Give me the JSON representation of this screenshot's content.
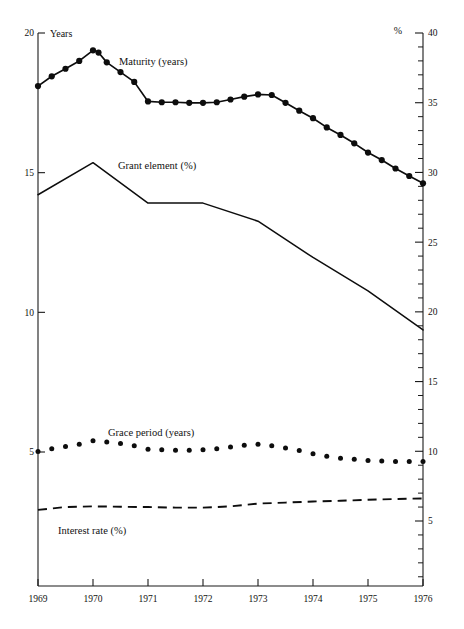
{
  "chart_data": {
    "type": "line",
    "title": "",
    "xlabel": "",
    "ylabel": "Years",
    "y2label": "%",
    "left_axis": {
      "unit": "Years",
      "ticks": [
        20,
        15,
        10,
        5
      ],
      "tick_labels": [
        "20",
        "15",
        "10",
        "5"
      ],
      "ylim": [
        3.2,
        20
      ]
    },
    "right_axis": {
      "unit": "%",
      "ticks": [
        40,
        35,
        30,
        25,
        20,
        15,
        10,
        5
      ],
      "tick_labels": [
        "40",
        "35",
        "30",
        "25",
        "20",
        "15",
        "10",
        "5"
      ],
      "minor_tick_step": 1,
      "ylim": [
        1.4,
        40
      ]
    },
    "x": [
      1969,
      1970,
      1971,
      1972,
      1973,
      1974,
      1975,
      1976
    ],
    "tick_labels_x": [
      "1969",
      "1970",
      "1971",
      "1972",
      "1973",
      "1974",
      "1975",
      "1976"
    ],
    "xlim": [
      1969,
      1976
    ],
    "grid": false,
    "legend_position": "inline-annotations",
    "series": [
      {
        "name": "Maturity (years)",
        "label": "Maturity (years)",
        "axis": "left",
        "style": "line-with-markers",
        "marker": "filled-circle",
        "x": [
          1969.0,
          1969.25,
          1969.5,
          1969.75,
          1970.0,
          1970.1,
          1970.25,
          1970.5,
          1970.75,
          1971.0,
          1971.25,
          1971.5,
          1971.75,
          1972.0,
          1972.25,
          1972.5,
          1972.75,
          1973.0,
          1973.25,
          1973.5,
          1973.75,
          1974.0,
          1974.25,
          1974.5,
          1974.75,
          1975.0,
          1975.25,
          1975.5,
          1975.75,
          1976.0
        ],
        "values": [
          18.1,
          18.45,
          18.72,
          19.0,
          19.38,
          19.3,
          18.95,
          18.6,
          18.25,
          17.55,
          17.52,
          17.52,
          17.5,
          17.5,
          17.52,
          17.62,
          17.72,
          17.8,
          17.78,
          17.5,
          17.22,
          16.95,
          16.62,
          16.35,
          16.05,
          15.72,
          15.45,
          15.15,
          14.88,
          14.62
        ]
      },
      {
        "name": "Grant element (%)",
        "label": "Grant element (%)",
        "axis": "right",
        "style": "solid-line",
        "marker": "none",
        "x": [
          1969,
          1970,
          1971,
          1972,
          1973,
          1974,
          1975,
          1976
        ],
        "values": [
          28.4,
          30.7,
          27.8,
          27.8,
          26.5,
          23.9,
          21.5,
          18.7
        ]
      },
      {
        "name": "Grace period (years)",
        "label": "Grace period (years)",
        "axis": "left",
        "style": "dotted-markers",
        "marker": "small-filled-circle",
        "x": [
          1969.0,
          1969.25,
          1969.5,
          1969.75,
          1970.0,
          1970.25,
          1970.5,
          1970.75,
          1971.0,
          1971.25,
          1971.5,
          1971.75,
          1972.0,
          1972.25,
          1972.5,
          1972.75,
          1973.0,
          1973.25,
          1973.5,
          1973.75,
          1974.0,
          1974.25,
          1974.5,
          1974.75,
          1975.0,
          1975.25,
          1975.5,
          1975.75,
          1976.0
        ],
        "values": [
          5.02,
          5.12,
          5.2,
          5.28,
          5.4,
          5.36,
          5.3,
          5.22,
          5.1,
          5.08,
          5.06,
          5.06,
          5.08,
          5.12,
          5.18,
          5.24,
          5.28,
          5.22,
          5.14,
          5.05,
          4.94,
          4.85,
          4.78,
          4.74,
          4.7,
          4.68,
          4.66,
          4.66,
          4.66
        ]
      },
      {
        "name": "Interest rate (%)",
        "label": "Interest rate (%)",
        "axis": "right",
        "style": "dashed-line",
        "marker": "none",
        "x": [
          1969.0,
          1969.5,
          1970.0,
          1970.5,
          1971.0,
          1971.5,
          1972.0,
          1972.5,
          1973.0,
          1973.5,
          1974.0,
          1974.5,
          1975.0,
          1975.5,
          1976.0
        ],
        "values": [
          5.8,
          6.0,
          6.05,
          6.02,
          6.0,
          5.96,
          5.96,
          6.05,
          6.25,
          6.32,
          6.4,
          6.45,
          6.52,
          6.58,
          6.62
        ]
      }
    ],
    "annotations": [
      {
        "text": "Maturity (years)",
        "x_px": 119,
        "y_px": 65,
        "anchor": "start"
      },
      {
        "text": "Grant element (%)",
        "x_px": 118,
        "y_px": 169,
        "anchor": "start"
      },
      {
        "text": "Grace period (years)",
        "x_px": 108,
        "y_px": 436,
        "anchor": "start"
      },
      {
        "text": "Interest rate (%)",
        "x_px": 58,
        "y_px": 534,
        "anchor": "start"
      }
    ]
  }
}
